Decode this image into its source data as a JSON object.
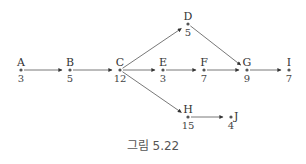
{
  "caption": "그림 5.22",
  "nodes": [
    {
      "id": "A",
      "label": "A",
      "duration": "3",
      "x": 21,
      "y": 70
    },
    {
      "id": "B",
      "label": "B",
      "duration": "5",
      "x": 70,
      "y": 70
    },
    {
      "id": "C",
      "label": "C",
      "duration": "12",
      "x": 120,
      "y": 70
    },
    {
      "id": "D",
      "label": "D",
      "duration": "5",
      "x": 188,
      "y": 24
    },
    {
      "id": "E",
      "label": "E",
      "duration": "3",
      "x": 163,
      "y": 70
    },
    {
      "id": "F",
      "label": "F",
      "duration": "7",
      "x": 204,
      "y": 70
    },
    {
      "id": "G",
      "label": "G",
      "duration": "9",
      "x": 247,
      "y": 70
    },
    {
      "id": "I",
      "label": "I",
      "duration": "7",
      "x": 289,
      "y": 70
    },
    {
      "id": "H",
      "label": "H",
      "duration": "15",
      "x": 188,
      "y": 117
    },
    {
      "id": "J",
      "label": "J",
      "duration": "4",
      "x": 231,
      "y": 117
    }
  ],
  "edges": [
    {
      "from": "A",
      "to": "B"
    },
    {
      "from": "B",
      "to": "C"
    },
    {
      "from": "C",
      "to": "D"
    },
    {
      "from": "C",
      "to": "E"
    },
    {
      "from": "C",
      "to": "H"
    },
    {
      "from": "D",
      "to": "G"
    },
    {
      "from": "E",
      "to": "F"
    },
    {
      "from": "F",
      "to": "G"
    },
    {
      "from": "G",
      "to": "I"
    },
    {
      "from": "H",
      "to": "J"
    }
  ]
}
